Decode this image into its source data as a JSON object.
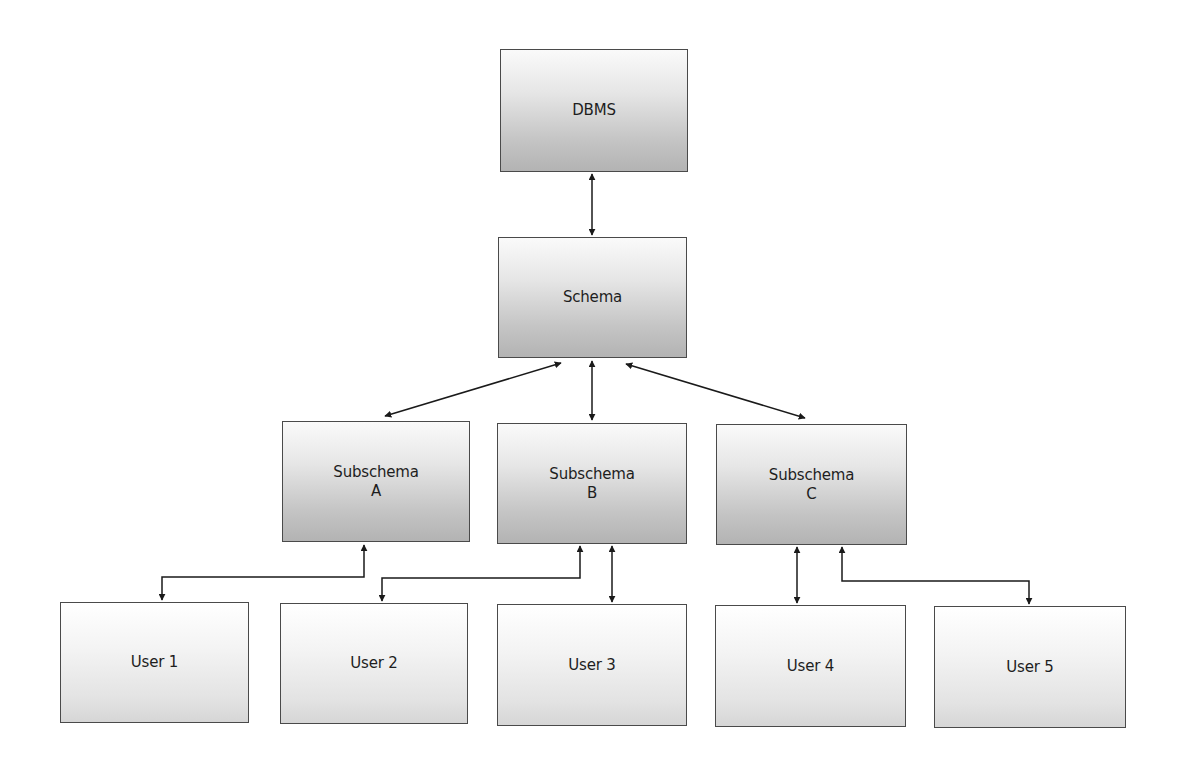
{
  "diagram": {
    "type": "hierarchy",
    "nodes": {
      "dbms": {
        "label": "DBMS"
      },
      "schema": {
        "label": "Schema"
      },
      "subschema_a": {
        "line1": "Subschema",
        "line2": "A"
      },
      "subschema_b": {
        "line1": "Subschema",
        "line2": "B"
      },
      "subschema_c": {
        "line1": "Subschema",
        "line2": "C"
      },
      "user1": {
        "label": "User 1"
      },
      "user2": {
        "label": "User 2"
      },
      "user3": {
        "label": "User 3"
      },
      "user4": {
        "label": "User 4"
      },
      "user5": {
        "label": "User 5"
      }
    },
    "edges": [
      {
        "from": "DBMS",
        "to": "Schema",
        "direction": "bidirectional"
      },
      {
        "from": "Schema",
        "to": "Subschema A",
        "direction": "bidirectional"
      },
      {
        "from": "Schema",
        "to": "Subschema B",
        "direction": "bidirectional"
      },
      {
        "from": "Schema",
        "to": "Subschema C",
        "direction": "bidirectional"
      },
      {
        "from": "Subschema A",
        "to": "User 1",
        "direction": "bidirectional"
      },
      {
        "from": "Subschema B",
        "to": "User 2",
        "direction": "bidirectional"
      },
      {
        "from": "Subschema B",
        "to": "User 3",
        "direction": "bidirectional"
      },
      {
        "from": "Subschema C",
        "to": "User 4",
        "direction": "bidirectional"
      },
      {
        "from": "Subschema C",
        "to": "User 5",
        "direction": "bidirectional"
      }
    ],
    "colors": {
      "border": "#4a4a4a",
      "arrow": "#1a1a1a",
      "dark_gradient_top": "#fafafa",
      "dark_gradient_bottom": "#b3b3b3",
      "light_gradient_top": "#ffffff",
      "light_gradient_bottom": "#d6d6d6"
    }
  }
}
